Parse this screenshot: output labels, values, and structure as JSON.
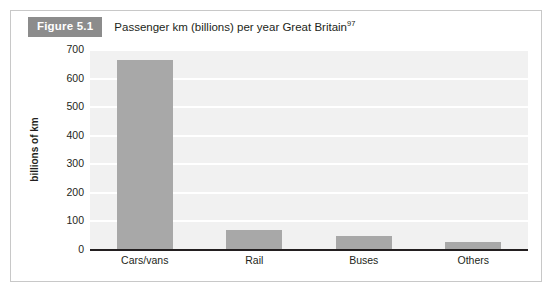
{
  "figure": {
    "badge": "Figure 5.1",
    "title": "Passenger km (billions) per year Great Britain",
    "footnote_marker": "97"
  },
  "colors": {
    "bar": "#a8a8a8",
    "plot_background": "#f1f1f1",
    "gridline": "#ffffff",
    "axis": "#231f20",
    "badge_background": "#8c8c8c",
    "card_border": "#c8c8c8"
  },
  "chart_data": {
    "type": "bar",
    "title": "Passenger km (billions) per year Great Britain",
    "categories": [
      "Cars/vans",
      "Rail",
      "Buses",
      "Others"
    ],
    "values": [
      660,
      68,
      47,
      23
    ],
    "xlabel": "",
    "ylabel": "billions of km",
    "ylim": [
      0,
      700
    ],
    "yticks": [
      0,
      100,
      200,
      300,
      400,
      500,
      600,
      700
    ],
    "ytick_labels": [
      "0",
      "100",
      "200",
      "300",
      "400",
      "500",
      "600",
      "700"
    ],
    "grid": "horizontal",
    "legend": "none",
    "series": [
      {
        "name": "Passenger km (billions)",
        "values": [
          660,
          68,
          47,
          23
        ]
      }
    ]
  }
}
